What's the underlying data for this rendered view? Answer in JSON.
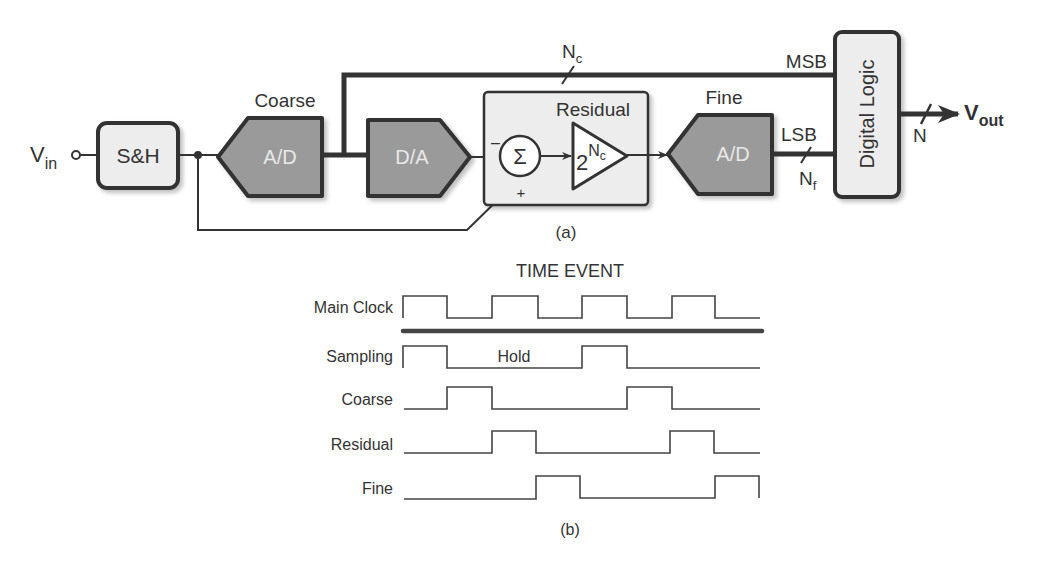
{
  "figure_a": {
    "caption": "(a)",
    "input_label": "V",
    "input_sub": "in",
    "blocks": {
      "sample_hold": "S&H",
      "coarse_adc": {
        "title": "Coarse",
        "label": "A/D"
      },
      "dac": {
        "label": "D/A"
      },
      "residual": {
        "title": "Residual",
        "sum_symbol": "Σ",
        "minus": "–",
        "plus": "+",
        "gain_base": "2",
        "gain_exp": "N",
        "gain_exp_sub": "c"
      },
      "fine_adc": {
        "title": "Fine",
        "label": "A/D"
      },
      "digital_logic": "Digital Logic"
    },
    "buses": {
      "coarse_bits": {
        "label": "N",
        "sub": "c"
      },
      "msb": "MSB",
      "lsb": "LSB",
      "fine_bits": {
        "label": "N",
        "sub": "f"
      },
      "output_bits": "N"
    },
    "output_label": "V",
    "output_sub": "out"
  },
  "figure_b": {
    "title": "TIME EVENT",
    "caption": "(b)",
    "hold_label": "Hold",
    "signals": [
      {
        "name": "Main Clock"
      },
      {
        "name": "Sampling"
      },
      {
        "name": "Coarse"
      },
      {
        "name": "Residual"
      },
      {
        "name": "Fine"
      }
    ]
  },
  "colors": {
    "stroke": "#333333",
    "converter_fill": "#9a9a9a",
    "block_fill": "#ededed"
  }
}
